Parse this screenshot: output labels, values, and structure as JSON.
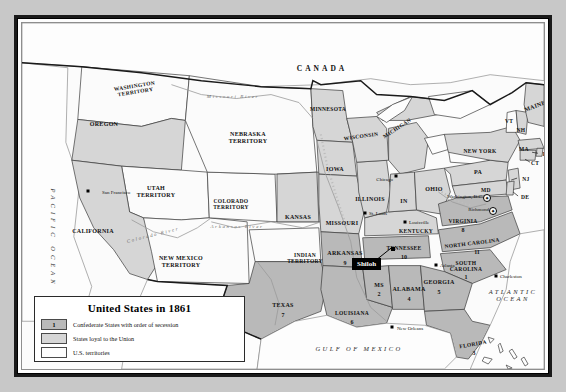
{
  "map": {
    "title": "United States in 1861",
    "colors": {
      "confederate": "#b9b9b9",
      "union": "#d6d6d6",
      "territory": "#fbfbfb",
      "water": "#fdfdfd",
      "page_background": "#c8c8c8",
      "frame": "#1a1a1a",
      "border_line": "#3a3a3a",
      "callout_background": "#000000",
      "callout_text": "#ffffff"
    },
    "countries": [
      {
        "name": "CANADA",
        "x": 300,
        "y": 45
      },
      {
        "name": "MEXICO",
        "x": 208,
        "y": 350
      }
    ],
    "oceans": [
      {
        "name": "PACIFIC OCEAN",
        "x": 31,
        "y": 215,
        "orientation": "vertical"
      },
      {
        "name": "ATLANTIC OCEAN",
        "x": 491,
        "y": 272,
        "orientation": "horizontal",
        "lines": [
          "ATLANTIC",
          "OCEAN"
        ]
      },
      {
        "name": "GULF OF MEXICO",
        "x": 337,
        "y": 325,
        "orientation": "horizontal"
      }
    ],
    "rivers": [
      {
        "name": "Missouri River",
        "x": 211,
        "y": 73
      },
      {
        "name": "Colorado River",
        "x": 131,
        "y": 212
      },
      {
        "name": "Arkansas River",
        "x": 215,
        "y": 203
      }
    ],
    "battles": [
      {
        "name": "Shiloh",
        "x": 358,
        "y": 241,
        "marker_x": 371,
        "marker_y": 226
      }
    ],
    "cities": [
      {
        "name": "San Francisco",
        "x": 80,
        "y": 169,
        "dot_x": 66,
        "dot_y": 168
      },
      {
        "name": "Chicago",
        "x": 357,
        "y": 156,
        "dot_x": 374,
        "dot_y": 153
      },
      {
        "name": "St. Louis",
        "x": 353,
        "y": 190,
        "dot_x": 343,
        "dot_y": 190
      },
      {
        "name": "Louisville",
        "x": 393,
        "y": 200,
        "dot_x": 383,
        "dot_y": 199
      },
      {
        "name": "Atlanta",
        "x": 425,
        "y": 243,
        "dot_x": 414,
        "dot_y": 242
      },
      {
        "name": "Charleston",
        "x": 487,
        "y": 254,
        "dot_x": 474,
        "dot_y": 253
      },
      {
        "name": "New Orleans",
        "x": 383,
        "y": 307,
        "dot_x": 370,
        "dot_y": 304
      }
    ],
    "capitals": [
      {
        "name": "Washington, D.C.",
        "label_x": 434,
        "label_y": 173,
        "marker_x": 465,
        "marker_y": 175
      },
      {
        "name": "Richmond",
        "label_x": 445,
        "label_y": 186,
        "marker_x": 471,
        "marker_y": 188
      }
    ],
    "states": [
      {
        "name": "WASHINGTON TERRITORY",
        "lines": [
          "WASHINGTON",
          "TERRITORY"
        ],
        "status": "territory",
        "x": 113,
        "y": 66,
        "size": "s55",
        "rotate": -9
      },
      {
        "name": "OREGON",
        "lines": [
          "OREGON"
        ],
        "status": "union",
        "x": 82,
        "y": 101,
        "size": "s6",
        "rotate": 0
      },
      {
        "name": "UTAH TERRITORY",
        "lines": [
          "UTAH",
          "TERRITORY"
        ],
        "status": "territory",
        "x": 134,
        "y": 169,
        "size": "s6",
        "rotate": 0
      },
      {
        "name": "CALIFORNIA",
        "lines": [
          "CALIFORNIA"
        ],
        "status": "union",
        "x": 71,
        "y": 208,
        "size": "s6",
        "rotate": 0
      },
      {
        "name": "NEW MEXICO TERRITORY",
        "lines": [
          "NEW MEXICO",
          "TERRITORY"
        ],
        "status": "territory",
        "x": 159,
        "y": 239,
        "size": "s6",
        "rotate": 0
      },
      {
        "name": "COLORADO TERRITORY",
        "lines": [
          "COLORADO",
          "TERRITORY"
        ],
        "status": "territory",
        "x": 209,
        "y": 181,
        "size": "s55",
        "rotate": 0
      },
      {
        "name": "NEBRASKA TERRITORY",
        "lines": [
          "NEBRASKA",
          "TERRITORY"
        ],
        "status": "territory",
        "x": 226,
        "y": 115,
        "size": "s6",
        "rotate": 0
      },
      {
        "name": "KANSAS",
        "lines": [
          "KANSAS"
        ],
        "status": "union",
        "x": 276,
        "y": 194,
        "size": "s6",
        "rotate": 0
      },
      {
        "name": "INDIAN TERRITORY",
        "lines": [
          "INDIAN",
          "TERRITORY"
        ],
        "status": "territory",
        "x": 283,
        "y": 235,
        "size": "s55",
        "rotate": 0
      },
      {
        "name": "TEXAS",
        "lines": [
          "TEXAS"
        ],
        "status": "confederate",
        "x": 261,
        "y": 282,
        "size": "s6",
        "rotate": 0,
        "number": "7",
        "num_x": 261,
        "num_y": 292
      },
      {
        "name": "MINNESOTA",
        "lines": [
          "MINNESOTA"
        ],
        "status": "union",
        "x": 306,
        "y": 86,
        "size": "s55",
        "rotate": 0
      },
      {
        "name": "WISCONSIN",
        "lines": [
          "WISCONSIN"
        ],
        "status": "union",
        "x": 339,
        "y": 113,
        "size": "s55",
        "rotate": -8
      },
      {
        "name": "MICHIGAN",
        "lines": [
          "MICHIGAN"
        ],
        "status": "union",
        "x": 375,
        "y": 105,
        "size": "s55",
        "rotate": -33
      },
      {
        "name": "IOWA",
        "lines": [
          "IOWA"
        ],
        "status": "union",
        "x": 313,
        "y": 146,
        "size": "s6",
        "rotate": 0
      },
      {
        "name": "ILLINOIS",
        "lines": [
          "ILLINOIS"
        ],
        "status": "union",
        "x": 348,
        "y": 176,
        "size": "s6",
        "rotate": 0
      },
      {
        "name": "IN",
        "lines": [
          "IN"
        ],
        "status": "union",
        "x": 382,
        "y": 178,
        "size": "s6",
        "rotate": 0
      },
      {
        "name": "OHIO",
        "lines": [
          "OHIO"
        ],
        "status": "union",
        "x": 412,
        "y": 166,
        "size": "s6",
        "rotate": 0
      },
      {
        "name": "MISSOURI",
        "lines": [
          "MISSOURI"
        ],
        "status": "union",
        "x": 320,
        "y": 200,
        "size": "s6",
        "rotate": 0
      },
      {
        "name": "KENTUCKY",
        "lines": [
          "KENTUCKY"
        ],
        "status": "union",
        "x": 394,
        "y": 208,
        "size": "s55",
        "rotate": 0
      },
      {
        "name": "ARKANSAS",
        "lines": [
          "ARKANSAS"
        ],
        "status": "confederate",
        "x": 323,
        "y": 230,
        "size": "s6",
        "rotate": 0,
        "number": "9",
        "num_x": 323,
        "num_y": 240
      },
      {
        "name": "TENNESSEE",
        "lines": [
          "TENNESSEE"
        ],
        "status": "confederate",
        "x": 382,
        "y": 225,
        "size": "s55",
        "rotate": 0,
        "number": "10",
        "num_x": 382,
        "num_y": 234
      },
      {
        "name": "MS",
        "lines": [
          "MS"
        ],
        "status": "confederate",
        "x": 357,
        "y": 262,
        "size": "s6",
        "rotate": 0,
        "number": "2",
        "num_x": 357,
        "num_y": 271
      },
      {
        "name": "ALABAMA",
        "lines": [
          "ALABAMA"
        ],
        "status": "confederate",
        "x": 387,
        "y": 266,
        "size": "s6",
        "rotate": 0,
        "number": "4",
        "num_x": 387,
        "num_y": 276
      },
      {
        "name": "GEORGIA",
        "lines": [
          "GEORGIA"
        ],
        "status": "confederate",
        "x": 417,
        "y": 259,
        "size": "s6",
        "rotate": 0,
        "number": "5",
        "num_x": 417,
        "num_y": 269
      },
      {
        "name": "LOUISIANA",
        "lines": [
          "LOUISIANA"
        ],
        "status": "confederate",
        "x": 330,
        "y": 290,
        "size": "s55",
        "rotate": 0,
        "number": "6",
        "num_x": 330,
        "num_y": 299
      },
      {
        "name": "FLORIDA",
        "lines": [
          "FLORIDA"
        ],
        "status": "confederate",
        "x": 451,
        "y": 321,
        "size": "s55",
        "rotate": -10,
        "number": "3",
        "num_x": 452,
        "num_y": 330
      },
      {
        "name": "NORTH CAROLINA",
        "lines": [
          "NORTH CAROLINA"
        ],
        "status": "confederate",
        "x": 450,
        "y": 220,
        "size": "s55",
        "rotate": -7,
        "number": "11",
        "num_x": 455,
        "num_y": 229
      },
      {
        "name": "SOUTH CAROLINA",
        "lines": [
          "SOUTH",
          "CAROLINA"
        ],
        "status": "confederate",
        "x": 444,
        "y": 243,
        "size": "s55",
        "rotate": 0,
        "number": "1",
        "num_x": 444,
        "num_y": 254
      },
      {
        "name": "VIRGINIA",
        "lines": [
          "VIRGINIA"
        ],
        "status": "confederate",
        "x": 441,
        "y": 198,
        "size": "s55",
        "rotate": 0,
        "number": "8",
        "num_x": 441,
        "num_y": 207
      },
      {
        "name": "MAINE",
        "lines": [
          "MAINE"
        ],
        "status": "union",
        "x": 513,
        "y": 83,
        "size": "s6",
        "rotate": -20
      },
      {
        "name": "VT",
        "lines": [
          "VT"
        ],
        "status": "union",
        "x": 487,
        "y": 98,
        "size": "s55",
        "rotate": 0
      },
      {
        "name": "NH",
        "lines": [
          "NH"
        ],
        "status": "union",
        "x": 499,
        "y": 107,
        "size": "s55",
        "rotate": 0
      },
      {
        "name": "NEW YORK",
        "lines": [
          "NEW YORK"
        ],
        "status": "union",
        "x": 458,
        "y": 128,
        "size": "s55",
        "rotate": 0
      },
      {
        "name": "MA",
        "lines": [
          "MA"
        ],
        "status": "union",
        "x": 502,
        "y": 126,
        "size": "s55",
        "rotate": 0
      },
      {
        "name": "RI",
        "lines": [
          "RI"
        ],
        "status": "union",
        "x": 524,
        "y": 131,
        "size": "s55",
        "rotate": 0
      },
      {
        "name": "CT",
        "lines": [
          "CT"
        ],
        "status": "union",
        "x": 513,
        "y": 140,
        "size": "s55",
        "rotate": 0
      },
      {
        "name": "PA",
        "lines": [
          "PA"
        ],
        "status": "union",
        "x": 456,
        "y": 149,
        "size": "s6",
        "rotate": 0
      },
      {
        "name": "NJ",
        "lines": [
          "NJ"
        ],
        "status": "union",
        "x": 504,
        "y": 156,
        "size": "s55",
        "rotate": 0
      },
      {
        "name": "MD",
        "lines": [
          "MD"
        ],
        "status": "union",
        "x": 464,
        "y": 167,
        "size": "s55",
        "rotate": 0
      },
      {
        "name": "DE",
        "lines": [
          "DE"
        ],
        "status": "union",
        "x": 503,
        "y": 174,
        "size": "s55",
        "rotate": 0
      }
    ],
    "legend": {
      "title": "United States in 1861",
      "rows": [
        {
          "swatch_label": "1",
          "text": "Confederate States with order of secession",
          "fill": "#b9b9b9"
        },
        {
          "swatch_label": "",
          "text": "States loyal to the Union",
          "fill": "#d6d6d6"
        },
        {
          "swatch_label": "",
          "text": "U.S. territories",
          "fill": "#fdfdfd"
        }
      ]
    }
  }
}
